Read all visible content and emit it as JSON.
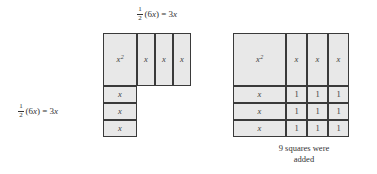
{
  "figure": {
    "title_hidden": "",
    "labels": {
      "top": {
        "frac_num": "1",
        "frac_den": "2",
        "rest_a": "(6",
        "rest_var": "x",
        "rest_b": ") = 3",
        "rest_var2": "x",
        "full_text": "1/2 (6x) = 3x"
      },
      "left": {
        "frac_num": "1",
        "frac_den": "2",
        "rest_a": "(6",
        "rest_var": "x",
        "rest_b": ") = 3",
        "rest_var2": "x",
        "full_text": "1/2 (6x) = 3x"
      }
    },
    "caption": "9 squares were\nadded",
    "colors": {
      "tile_fill": "#e8e8e8",
      "tile_border": "#3a3a3a",
      "text": "#333333",
      "background": "#ffffff"
    },
    "left_diagram": {
      "name": "incomplete-square",
      "x_squared_tile": {
        "label_base": "x",
        "label_exp": "2"
      },
      "top_x_tiles": [
        {
          "label": "x"
        },
        {
          "label": "x"
        },
        {
          "label": "x"
        }
      ],
      "side_x_tiles": [
        {
          "label": "x"
        },
        {
          "label": "x"
        },
        {
          "label": "x"
        }
      ],
      "unit_tiles": []
    },
    "right_diagram": {
      "name": "completed-square",
      "x_squared_tile": {
        "label_base": "x",
        "label_exp": "2"
      },
      "top_x_tiles": [
        {
          "label": "x"
        },
        {
          "label": "x"
        },
        {
          "label": "x"
        }
      ],
      "side_x_tiles": [
        {
          "label": "x"
        },
        {
          "label": "x"
        },
        {
          "label": "x"
        }
      ],
      "unit_rows": [
        [
          {
            "label": "1"
          },
          {
            "label": "1"
          },
          {
            "label": "1"
          }
        ],
        [
          {
            "label": "1"
          },
          {
            "label": "1"
          },
          {
            "label": "1"
          }
        ],
        [
          {
            "label": "1"
          },
          {
            "label": "1"
          },
          {
            "label": "1"
          }
        ]
      ],
      "unit_count": 9
    }
  }
}
